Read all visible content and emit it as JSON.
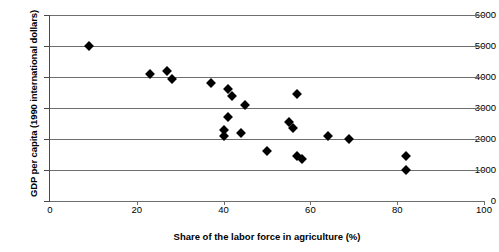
{
  "chart_data": {
    "type": "scatter",
    "title": "",
    "xlabel": "Share of the labor force in agriculture (%)",
    "ylabel": "GDP per capita (1990 international dollars)",
    "xlim": [
      0,
      100
    ],
    "ylim": [
      0,
      6000
    ],
    "xticks": [
      0,
      20,
      40,
      60,
      80,
      100
    ],
    "yticks": [
      0,
      1000,
      2000,
      3000,
      4000,
      5000,
      6000
    ],
    "grid": "horizontal",
    "legend": "none",
    "marker": "filled-diamond",
    "marker_color": "#000000",
    "points": [
      {
        "x": 9,
        "y": 5000
      },
      {
        "x": 23,
        "y": 4100
      },
      {
        "x": 27,
        "y": 4200
      },
      {
        "x": 28,
        "y": 3950
      },
      {
        "x": 37,
        "y": 3800
      },
      {
        "x": 41,
        "y": 3600
      },
      {
        "x": 42,
        "y": 3400
      },
      {
        "x": 45,
        "y": 3100
      },
      {
        "x": 41,
        "y": 2700
      },
      {
        "x": 40,
        "y": 2300
      },
      {
        "x": 40,
        "y": 2100
      },
      {
        "x": 44,
        "y": 2200
      },
      {
        "x": 50,
        "y": 1600
      },
      {
        "x": 55,
        "y": 2550
      },
      {
        "x": 56,
        "y": 2350
      },
      {
        "x": 57,
        "y": 3450
      },
      {
        "x": 57,
        "y": 1450
      },
      {
        "x": 58,
        "y": 1350
      },
      {
        "x": 64,
        "y": 2100
      },
      {
        "x": 69,
        "y": 2000
      },
      {
        "x": 82,
        "y": 1450
      },
      {
        "x": 82,
        "y": 1000
      }
    ]
  },
  "axes": {
    "y_tick_labels": [
      "6000",
      "5000",
      "4000",
      "3000",
      "2000",
      "1000",
      "0"
    ],
    "x_tick_labels": [
      "0",
      "20",
      "40",
      "60",
      "80",
      "100"
    ]
  }
}
